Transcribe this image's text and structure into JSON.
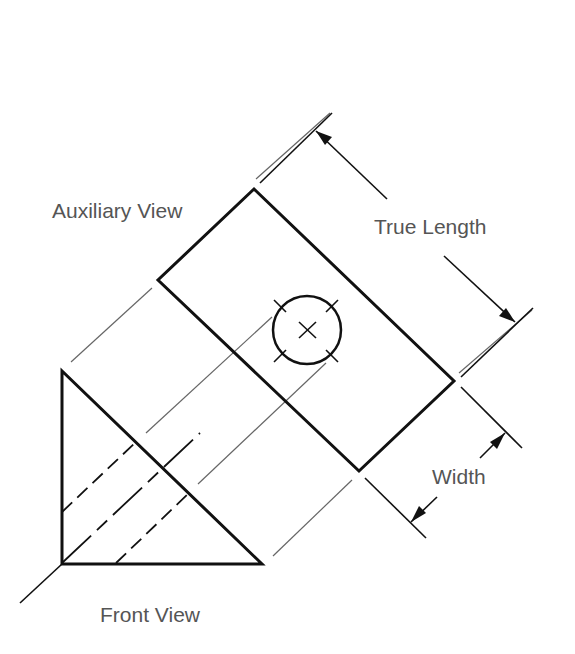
{
  "figure": {
    "labels": {
      "auxiliary_view": "Auxiliary View",
      "true_length": "True Length",
      "width": "Width",
      "front_view": "Front View"
    },
    "colors": {
      "object_line": "#111111",
      "projection_line": "#666666",
      "label_text": "#555555"
    }
  }
}
